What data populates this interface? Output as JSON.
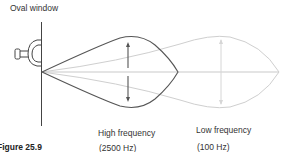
{
  "diagram": {
    "title_label": "Oval window",
    "high": {
      "label": "High frequency",
      "hz": "(2500 Hz)",
      "color": "#555555"
    },
    "low": {
      "label": "Low frequency",
      "hz": "(100 Hz)",
      "color": "#c8c8c8"
    },
    "caption": "Figure 25.9"
  }
}
